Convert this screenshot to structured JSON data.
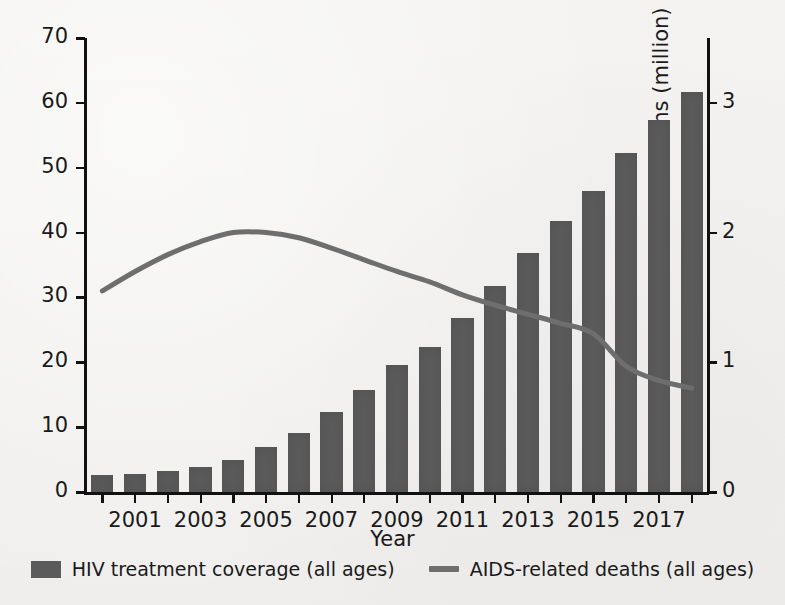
{
  "chart_data": {
    "type": "bar",
    "title": "",
    "xlabel": "Year",
    "ylabel": "Antiretroviral therapy coverage (%)",
    "y2label": "Number of AIDS-related deaths (million)",
    "grid": false,
    "legend_position": "bottom",
    "ylim": [
      0,
      70
    ],
    "y2lim": [
      0,
      3.5
    ],
    "yticks": [
      "0",
      "10",
      "20",
      "30",
      "40",
      "50",
      "60",
      "70"
    ],
    "ytick_values": [
      0,
      10,
      20,
      30,
      40,
      50,
      60,
      70
    ],
    "y2ticks": [
      "0",
      "1",
      "2",
      "3"
    ],
    "y2tick_values": [
      0,
      1,
      2,
      3
    ],
    "xticks": [
      "2001",
      "2003",
      "2005",
      "2007",
      "2009",
      "2011",
      "2013",
      "2015",
      "2017"
    ],
    "x": [
      2000,
      2001,
      2002,
      2003,
      2004,
      2005,
      2006,
      2007,
      2008,
      2009,
      2010,
      2011,
      2012,
      2013,
      2014,
      2015,
      2016,
      2017,
      2018
    ],
    "categories": [
      "2000",
      "2001",
      "2002",
      "2003",
      "2004",
      "2005",
      "2006",
      "2007",
      "2008",
      "2009",
      "2010",
      "2011",
      "2012",
      "2013",
      "2014",
      "2015",
      "2016",
      "2017",
      "2018"
    ],
    "series": [
      {
        "name": "HIV treatment coverage (all ages)",
        "type": "bar",
        "axis": "left",
        "units": "%",
        "color": "#5b5b5b",
        "values": [
          2.7,
          2.8,
          3.2,
          3.8,
          5.0,
          6.9,
          9.1,
          12.3,
          15.8,
          19.6,
          22.3,
          26.8,
          31.7,
          36.8,
          41.8,
          46.4,
          52.3,
          57.3,
          61.6
        ]
      },
      {
        "name": "AIDS-related deaths (all ages)",
        "type": "line",
        "axis": "right",
        "units": "million",
        "color": "#6e6e6e",
        "values": [
          1.55,
          1.7,
          1.83,
          1.93,
          2.0,
          2.0,
          1.96,
          1.88,
          1.79,
          1.7,
          1.62,
          1.52,
          1.44,
          1.37,
          1.3,
          1.22,
          0.97,
          0.86,
          0.8
        ]
      }
    ]
  },
  "legend": {
    "items": [
      {
        "label": "HIV treatment coverage (all ages)",
        "marker": "bar-swatch"
      },
      {
        "label": "AIDS-related deaths (all ages)",
        "marker": "line-swatch"
      }
    ]
  },
  "axes": {
    "x_title": "Year",
    "y_left_title": "Antiretroviral therapy coverage (%)",
    "y_right_title": "Number of AIDS-related deaths (million)"
  },
  "colors": {
    "bar": "#5b5b5b",
    "line": "#6e6e6e",
    "axis": "#111111",
    "background": "#f2f1ef",
    "text": "#1a1a1a"
  }
}
